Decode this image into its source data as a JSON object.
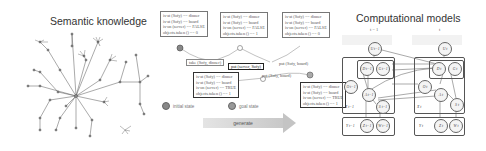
{
  "panels": {
    "semantic": {
      "title": "Semantic knowledge"
    },
    "planning": {
      "states": [
        {
          "id": "s0",
          "lines": [
            "is-at (Sofy) == dinner",
            "is-at (Sofy) == board",
            "is-on (server) == FALSE",
            "objects.taken () == 0"
          ]
        },
        {
          "id": "s1",
          "lines": [
            "is-at (Sofy) == dinner",
            "is-at (Sofy) == board",
            "is-on (server) == FALSE",
            "objects.taken () == 1"
          ]
        },
        {
          "id": "s2",
          "lines": [
            "is-at (Sofy) == dinner",
            "is-at (Sofy) == board",
            "is-on (server) == FALSE",
            "objects.taken () == 0"
          ]
        },
        {
          "id": "s3",
          "lines": [
            "is-at (Sofy) == dinner",
            "is-at (Sofy) == board",
            "is-on (server) == TRUE",
            "objects.taken () == 1"
          ]
        },
        {
          "id": "s4",
          "lines": [
            "is-at (Sofy) == dinner",
            "is-at (Sofy) == board",
            "is-on (server) == TRUE",
            "objects.taken () == 1"
          ]
        }
      ],
      "actions": {
        "a1": "take (Sofy, dinner)",
        "a2": "put (server, Sofy)",
        "a3": "put (Sofy, board)",
        "a4": "put (Sofy, board)"
      },
      "legend": {
        "initial": "initial state",
        "goal": "goal state"
      },
      "arrow_label": "generate"
    },
    "computational": {
      "title": "Computational models",
      "time_prev": "t − 1",
      "time_curr": "t",
      "nodes_prev": {
        "u": "U t−1",
        "d": "D t−1",
        "g": "G t−1",
        "o": "O t−1",
        "a": "A t−1",
        "s": "S t−1",
        "x_label": "X t−1",
        "y": "Y t−1",
        "z": "Z t−1",
        "w": "W t−1"
      },
      "nodes_curr": {
        "u": "U t",
        "d": "D t",
        "g": "G t",
        "o": "O t",
        "a": "A t",
        "s": "S t",
        "x_label": "X t",
        "y": "Y t",
        "z": "Z t",
        "w": "W t"
      }
    }
  },
  "colors": {
    "line": "#555555",
    "node_fill": "#f4f4f4",
    "arrow": "#c8c8c8",
    "background": "#ffffff"
  }
}
